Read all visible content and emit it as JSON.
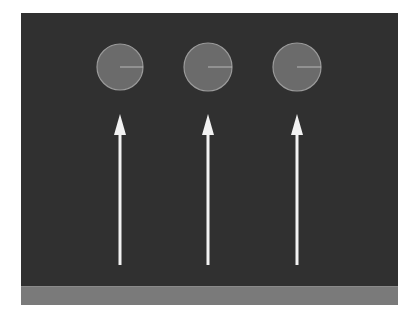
{
  "scene": {
    "background_color": "#303030",
    "floor_color": "#7a7a7a",
    "ball_fill": "#6b6b6b",
    "ball_stroke": "#9a9a9a",
    "arrow_color": "#f2f2f2"
  },
  "balls": [
    {
      "id": 1,
      "cx": 120,
      "cy": 67,
      "r": 23
    },
    {
      "id": 2,
      "cx": 208,
      "cy": 67,
      "r": 24
    },
    {
      "id": 3,
      "cx": 297,
      "cy": 67,
      "r": 24
    }
  ],
  "arrows": [
    {
      "id": 1,
      "x": 120,
      "y_start": 265,
      "y_tip": 114
    },
    {
      "id": 2,
      "x": 208,
      "y_start": 265,
      "y_tip": 114
    },
    {
      "id": 3,
      "x": 297,
      "y_start": 265,
      "y_tip": 114
    }
  ]
}
